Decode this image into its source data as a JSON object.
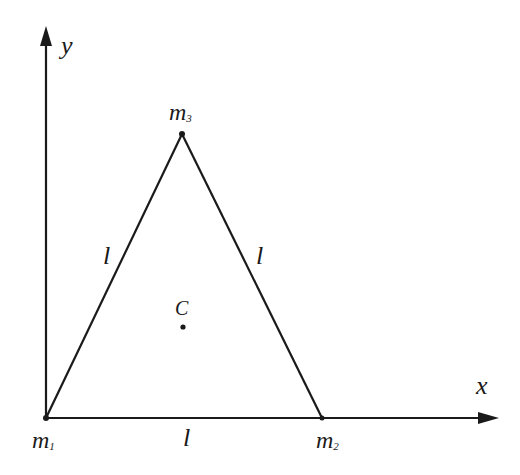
{
  "diagram": {
    "type": "geometry",
    "axes": {
      "x_label": "x",
      "y_label": "y"
    },
    "vertices": [
      {
        "id": "m1",
        "label_main": "m",
        "label_sub": "1",
        "position": "origin"
      },
      {
        "id": "m2",
        "label_main": "m",
        "label_sub": "2",
        "position": "on x-axis"
      },
      {
        "id": "m3",
        "label_main": "m",
        "label_sub": "3",
        "position": "apex"
      }
    ],
    "sides": [
      {
        "between": [
          "m1",
          "m3"
        ],
        "label": "l"
      },
      {
        "between": [
          "m3",
          "m2"
        ],
        "label": "l"
      },
      {
        "between": [
          "m1",
          "m2"
        ],
        "label": "l"
      }
    ],
    "center": {
      "label": "C"
    },
    "colors": {
      "line": "#1a1a1a",
      "background": "#ffffff"
    }
  }
}
